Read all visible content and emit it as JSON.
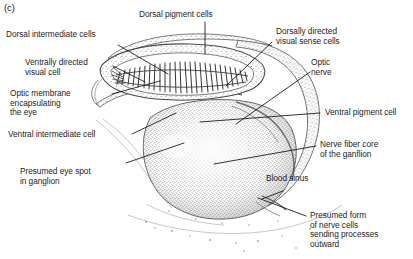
{
  "panel": {
    "letter": "(c)"
  },
  "figure": {
    "name": "eye-and-ganglion-cross-section"
  },
  "labels": [
    {
      "id": "dorsal-intermediate-cells",
      "text": "Dorsal intermediate cells"
    },
    {
      "id": "dorsal-pigment-cells",
      "text": "Dorsal pigment cells"
    },
    {
      "id": "dorsally-directed-visual-sense-cells",
      "text": "Dorsally directed\nvisual sense cells"
    },
    {
      "id": "ventrally-directed-visual-cell",
      "text": "Ventrally directed\nvisual cell"
    },
    {
      "id": "optic-nerve",
      "text": "Optic\nnerve"
    },
    {
      "id": "optic-membrane-encapsulating-the-eye",
      "text": "Optic membrane\nencapsulating\nthe eye"
    },
    {
      "id": "ventral-pigment-cell",
      "text": "Ventral pigment cell"
    },
    {
      "id": "ventral-intermediate-cell",
      "text": "Ventral intermediate cell"
    },
    {
      "id": "nerve-fiber-core-of-the-ganglion",
      "text": "Nerve fiber core\nof the ganflion"
    },
    {
      "id": "presumed-eye-spot-in-ganglion",
      "text": "Presumed eye spot\nin ganglion"
    },
    {
      "id": "blood-sinus",
      "text": "Blood sinus"
    },
    {
      "id": "presumed-form-of-nerve-cells",
      "text": "Presumed form\nof nerve cells\nsending processes\noutward"
    }
  ],
  "colors": {
    "background": "#ffffff",
    "ink": "#1d1d1d",
    "leader": "#111111",
    "stipple": "#6d6d6d",
    "outline": "#555555"
  }
}
